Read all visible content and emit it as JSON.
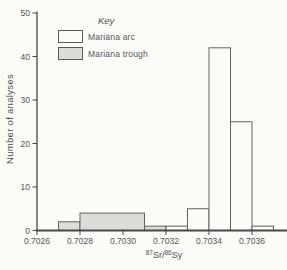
{
  "figure": {
    "ylabel": "Number of analyses",
    "xlabel_parts": {
      "sup1": "87",
      "base1": "Sr/",
      "sup2": "86",
      "base2": "Sy"
    },
    "legend": {
      "title": "Key",
      "items": [
        {
          "label": "Mariana arc",
          "fill": "#fbfbf8"
        },
        {
          "label": "Mariana trough",
          "fill": "#dcdcd8"
        }
      ]
    }
  },
  "chart_data": {
    "type": "bar",
    "subtype": "histogram",
    "title": "",
    "xlabel": "87Sr/86Sy",
    "ylabel": "Number of analyses",
    "ylim": [
      0,
      50
    ],
    "yticks": [
      0,
      10,
      20,
      30,
      40,
      50
    ],
    "xlim": [
      0.7026,
      0.7037
    ],
    "xticks": [
      "0.7026",
      "0.7028",
      "0.7030",
      "0.7032",
      "0.7034",
      "0.7036"
    ],
    "bin_width": 0.0001,
    "grid": false,
    "legend_position": "upper-left",
    "axis_color": "#474747",
    "bar_stroke_color": "#626262",
    "text_color": "#545454",
    "series": [
      {
        "name": "Mariana arc",
        "fill": "#fbfbf8",
        "bins": [
          {
            "x1": 0.7032,
            "x2": 0.7033,
            "count": 1
          },
          {
            "x1": 0.7033,
            "x2": 0.7034,
            "count": 5
          },
          {
            "x1": 0.7034,
            "x2": 0.7035,
            "count": 42
          },
          {
            "x1": 0.7035,
            "x2": 0.7036,
            "count": 25
          },
          {
            "x1": 0.7036,
            "x2": 0.7037,
            "count": 1
          }
        ]
      },
      {
        "name": "Mariana trough",
        "fill": "#dcdcd8",
        "bins": [
          {
            "x1": 0.7027,
            "x2": 0.7028,
            "count": 2
          },
          {
            "x1": 0.7028,
            "x2": 0.7031,
            "count": 4
          },
          {
            "x1": 0.7031,
            "x2": 0.7032,
            "count": 1
          }
        ]
      }
    ]
  }
}
